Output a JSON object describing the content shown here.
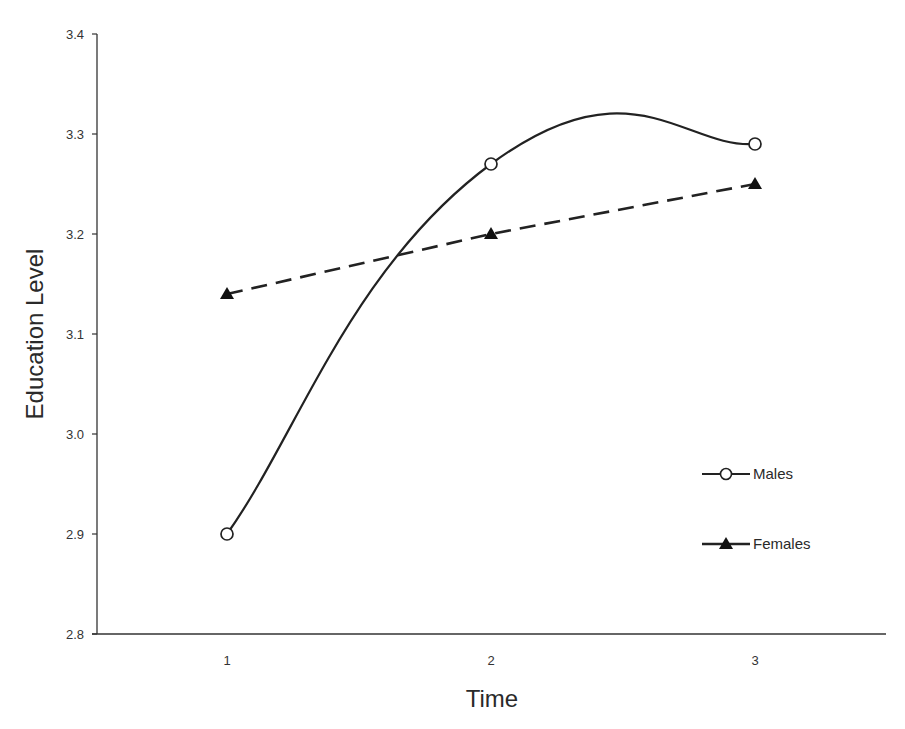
{
  "chart_data": {
    "type": "line",
    "title": "",
    "xlabel": "Time",
    "ylabel": "Education Level",
    "categories": [
      "1",
      "2",
      "3"
    ],
    "x": [
      1,
      2,
      3
    ],
    "ylim": [
      2.8,
      3.4
    ],
    "yticks": [
      "2.8",
      "2.9",
      "3.0",
      "3.1",
      "3.2",
      "3.3",
      "3.4"
    ],
    "xticks": [
      "1",
      "2",
      "3"
    ],
    "grid": false,
    "legend_position": "right-center",
    "series": [
      {
        "name": "Males",
        "values": [
          2.9,
          3.27,
          3.29
        ],
        "line_style": "solid-smoothed",
        "marker": "open-circle",
        "color": "#222222"
      },
      {
        "name": "Females",
        "values": [
          3.14,
          3.2,
          3.25
        ],
        "line_style": "dashed",
        "marker": "filled-triangle",
        "color": "#222222"
      }
    ]
  }
}
